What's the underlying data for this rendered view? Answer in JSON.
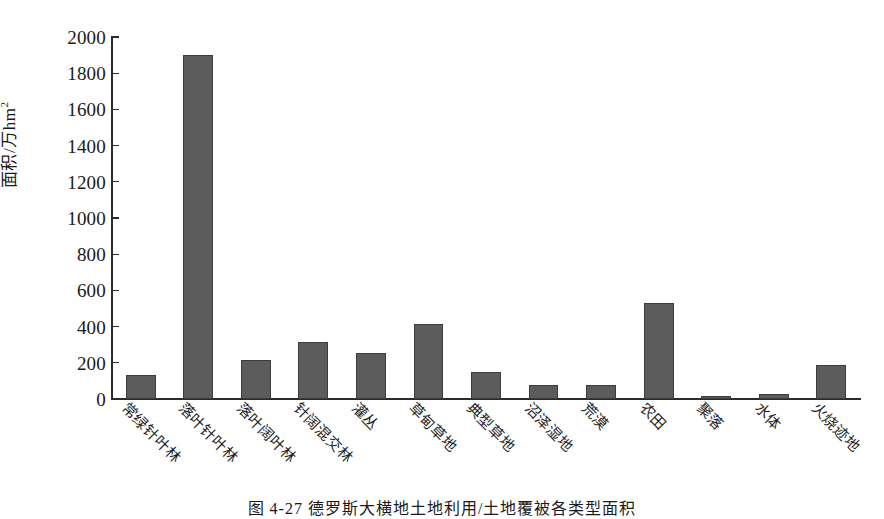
{
  "chart_data": {
    "type": "bar",
    "title": "",
    "caption": "图 4-27  德罗斯大横地土地利用/土地覆被各类型面积",
    "xlabel": "",
    "ylabel": "面积/万hm",
    "ylabel_sup": "2",
    "ylim": [
      0,
      2000
    ],
    "ytick_step": 200,
    "yticks": [
      "2000",
      "1800",
      "1600",
      "1400",
      "1200",
      "1000",
      "800",
      "600",
      "400",
      "200",
      "0"
    ],
    "grid": false,
    "legend": null,
    "bar_color": "#5c5c5c",
    "bar_edge_color": "#3d3d3d",
    "axis_color": "#2b2b2b",
    "categories": [
      "常绿针叶林",
      "落叶针叶林",
      "落叶阔叶林",
      "针阔混交林",
      "灌丛",
      "草甸草地",
      "典型草地",
      "沼泽湿地",
      "荒漠",
      "农田",
      "聚落",
      "水体",
      "火烧迹地"
    ],
    "values": [
      133,
      1900,
      215,
      315,
      253,
      415,
      150,
      78,
      80,
      530,
      15,
      25,
      188
    ]
  }
}
